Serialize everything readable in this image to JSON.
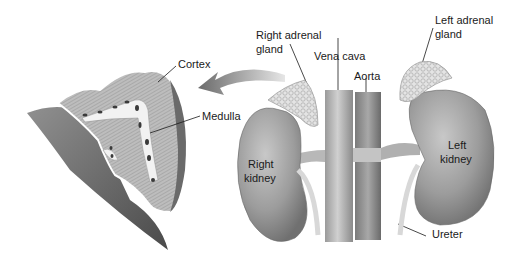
{
  "diagram": {
    "labels": {
      "cortex": "Cortex",
      "medulla": "Medulla",
      "right_adrenal_line1": "Right adrenal",
      "right_adrenal_line2": "gland",
      "vena_cava": "Vena cava",
      "aorta": "Aorta",
      "left_adrenal_line1": "Left adrenal",
      "left_adrenal_line2": "gland",
      "right_kidney_line1": "Right",
      "right_kidney_line2": "kidney",
      "left_kidney_line1": "Left",
      "left_kidney_line2": "kidney",
      "ureter": "Ureter"
    },
    "callout_arrow": "right adrenal gland magnified cross-section",
    "colors": {
      "background": "#ffffff",
      "organ_fill": "#a8a8a8",
      "organ_dark": "#6e6e6e",
      "gland_fill": "#e0e0e0",
      "vessel_fill": "#b4b4b4",
      "text": "#1a1a1a"
    }
  }
}
